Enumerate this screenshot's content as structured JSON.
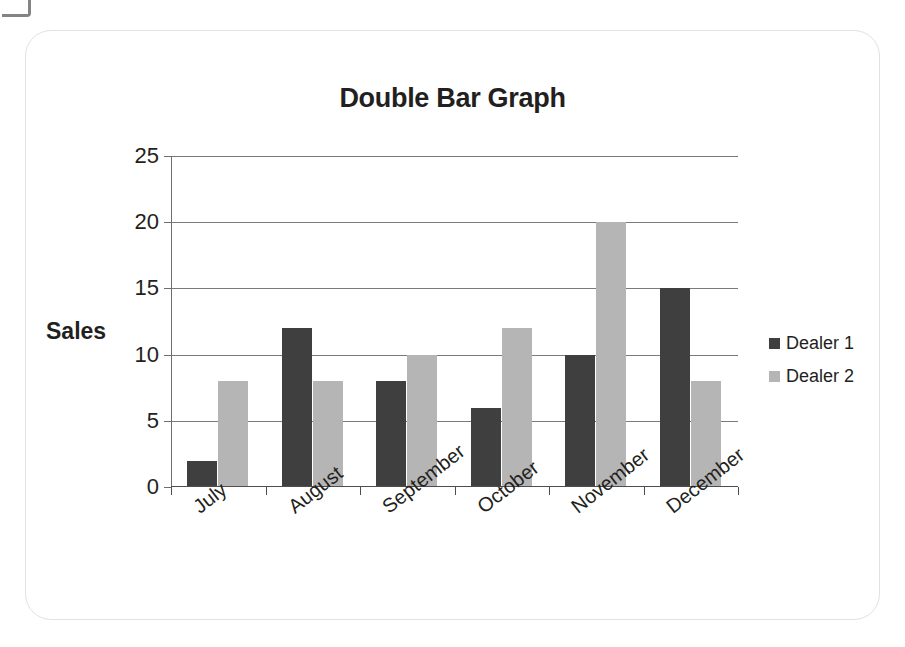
{
  "card": {
    "artifact_name": "scan-corner-artifact"
  },
  "chart_data": {
    "type": "bar",
    "title": "Double Bar Graph",
    "xlabel": "",
    "ylabel": "Sales",
    "categories": [
      "July",
      "August",
      "September",
      "October",
      "November",
      "December"
    ],
    "series": [
      {
        "name": "Dealer 1",
        "color": "#3f3f3f",
        "values": [
          2,
          12,
          8,
          6,
          10,
          15
        ]
      },
      {
        "name": "Dealer 2",
        "color": "#b5b5b5",
        "values": [
          8,
          8,
          10,
          12,
          20,
          8
        ]
      }
    ],
    "ylim": [
      0,
      25
    ],
    "yticks": [
      0,
      5,
      10,
      15,
      20,
      25
    ],
    "ytick_labels": [
      "0",
      "5",
      "10",
      "15",
      "20",
      "25"
    ],
    "grid": true,
    "grid_axis": "y",
    "legend_position": "right",
    "xtick_rotation": -38
  }
}
